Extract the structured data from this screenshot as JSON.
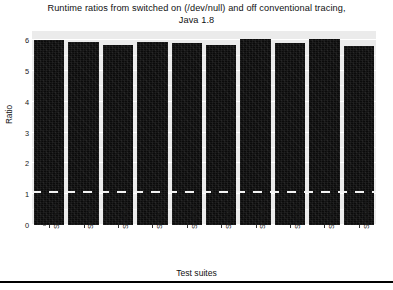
{
  "chart_data": {
    "type": "bar",
    "title": "Runtime ratios from switched on (/dev/null) and off conventional tracing, Java 1.8",
    "title_lines": [
      "Runtime ratios from switched on (/dev/null) and off conventional tracing,",
      "Java 1.8"
    ],
    "xlabel": "Test suites",
    "ylabel": "Ratio",
    "categories": [
      "SUITE1",
      "SUITE2",
      "SUITE3",
      "SUITE4",
      "SUITE5",
      "SUITE6",
      "SUITE7",
      "SUITE8",
      "SUITE9",
      "SUITE10"
    ],
    "values": [
      6.0,
      5.95,
      5.85,
      5.95,
      5.9,
      5.85,
      6.05,
      5.9,
      6.05,
      5.8
    ],
    "ylim": [
      0,
      6.3
    ],
    "yticks": [
      0,
      1,
      2,
      3,
      4,
      5,
      6
    ],
    "ytick_labels": [
      "0",
      "1",
      "2",
      "3",
      "4",
      "5",
      "6"
    ],
    "grid": true,
    "legend": "none",
    "bar_color": "#0b0b0b",
    "panel_color": "#ebebeb",
    "gridline_color": "#ffffff",
    "reference_line": {
      "value": 1,
      "style": "dashed",
      "color": "#f2f2f2",
      "label": "1"
    }
  }
}
